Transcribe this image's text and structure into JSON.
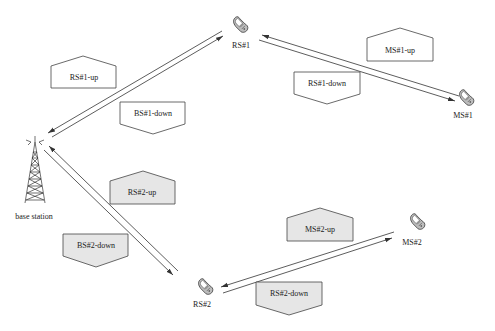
{
  "diagram": {
    "type": "relay-network",
    "colors": {
      "line": "#333333",
      "box_stroke": "#444444",
      "box_fill_white": "#ffffff",
      "box_fill_gray": "#e6e6e6"
    },
    "nodes": {
      "base_station": {
        "label": "base station",
        "icon": "cell-tower-icon"
      },
      "rs1": {
        "label": "RS#1",
        "icon": "phone-icon"
      },
      "ms1": {
        "label": "MS#1",
        "icon": "phone-icon"
      },
      "rs2": {
        "label": "RS#2",
        "icon": "phone-icon"
      },
      "ms2": {
        "label": "MS#2",
        "icon": "phone-icon"
      }
    },
    "frames": {
      "rs1_up": {
        "label": "RS#1-up",
        "shape": "up-pentagon",
        "fill": "white"
      },
      "bs1_down": {
        "label": "BS#1-down",
        "shape": "down-pentagon",
        "fill": "white"
      },
      "ms1_up": {
        "label": "MS#1-up",
        "shape": "up-pentagon",
        "fill": "white"
      },
      "rs1_down": {
        "label": "RS#1-down",
        "shape": "down-pentagon",
        "fill": "white"
      },
      "rs2_up": {
        "label": "RS#2-up",
        "shape": "up-pentagon",
        "fill": "gray"
      },
      "bs2_down": {
        "label": "BS#2-down",
        "shape": "down-pentagon",
        "fill": "gray"
      },
      "ms2_up": {
        "label": "MS#2-up",
        "shape": "up-pentagon",
        "fill": "gray"
      },
      "rs2_down": {
        "label": "RS#2-down",
        "shape": "down-pentagon",
        "fill": "gray"
      }
    },
    "links": [
      {
        "from": "base station",
        "to": "RS#1",
        "direction": "bidirectional"
      },
      {
        "from": "RS#1",
        "to": "MS#1",
        "direction": "bidirectional"
      },
      {
        "from": "base station",
        "to": "RS#2",
        "direction": "bidirectional"
      },
      {
        "from": "RS#2",
        "to": "MS#2",
        "direction": "bidirectional"
      }
    ]
  }
}
